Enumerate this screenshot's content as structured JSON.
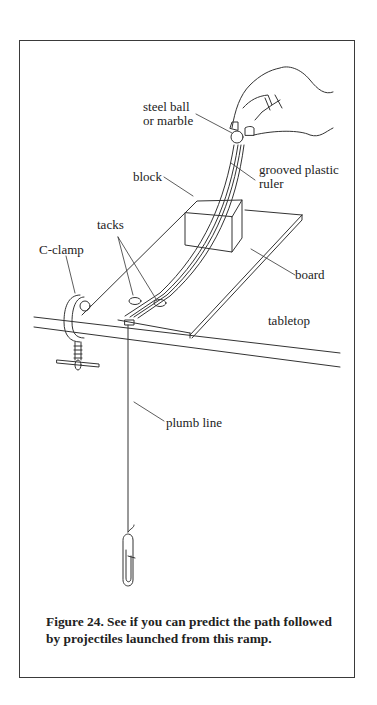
{
  "figure": {
    "number": "Figure 24.",
    "caption": "Figure 24.  See if you can predict the path followed by projectiles launched from this ramp.",
    "labels": {
      "steel_ball": "steel ball",
      "marble": "or marble",
      "ruler_line1": "grooved plastic",
      "ruler_line2": "ruler",
      "block": "block",
      "tacks": "tacks",
      "c_clamp": "C-clamp",
      "board": "board",
      "tabletop": "tabletop",
      "plumb_line": "plumb line"
    }
  }
}
